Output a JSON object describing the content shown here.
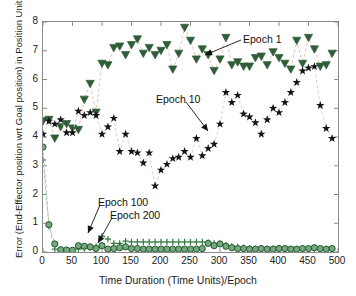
{
  "chart_data": {
    "type": "scatter",
    "title": "",
    "xlabel": "Time Duration (Time Units)/Epoch",
    "ylabel": "Error (End-Effector position wrt Goal position) in Position Units",
    "xlim": [
      0,
      500
    ],
    "ylim": [
      0,
      8
    ],
    "xticks": [
      0,
      50,
      100,
      150,
      200,
      250,
      300,
      350,
      400,
      450,
      500
    ],
    "yticks": [
      0,
      1,
      2,
      3,
      4,
      5,
      6,
      7,
      8
    ],
    "grid": false,
    "legend_position": "annotations-inline",
    "x": [
      0,
      10,
      20,
      30,
      40,
      50,
      60,
      70,
      80,
      90,
      100,
      110,
      120,
      130,
      140,
      150,
      160,
      170,
      180,
      190,
      200,
      210,
      220,
      230,
      240,
      250,
      260,
      270,
      280,
      290,
      300,
      310,
      320,
      330,
      340,
      350,
      360,
      370,
      380,
      390,
      400,
      410,
      420,
      430,
      440,
      450,
      460,
      470,
      480,
      490
    ],
    "series": [
      {
        "name": "Epoch 1",
        "marker": "triangle-down",
        "color": "#2f5d37",
        "line_color": "#e8b9a8",
        "values": [
          4.55,
          4.6,
          3.95,
          4.35,
          4.45,
          4.3,
          4.25,
          5.3,
          5.85,
          4.85,
          6.55,
          6.5,
          7.1,
          7.15,
          6.85,
          7.2,
          7.4,
          6.9,
          7.1,
          6.85,
          7.0,
          7.2,
          6.35,
          6.9,
          7.8,
          7.35,
          6.7,
          7.05,
          6.85,
          6.3,
          6.7,
          7.45,
          6.5,
          6.6,
          6.45,
          6.45,
          6.75,
          6.8,
          6.5,
          6.95,
          6.75,
          6.55,
          6.35,
          7.35,
          6.55,
          7.45,
          7.05,
          6.45,
          6.5,
          6.9
        ]
      },
      {
        "name": "Epoch 10",
        "marker": "star",
        "color": "#141414",
        "line_color": "#cccccc",
        "values": [
          4.1,
          4.55,
          4.45,
          4.6,
          4.15,
          4.15,
          4.9,
          4.75,
          4.85,
          4.75,
          4.1,
          4.35,
          4.65,
          3.5,
          4.1,
          3.5,
          3.45,
          3.1,
          3.45,
          2.3,
          2.85,
          3.05,
          3.25,
          3.3,
          3.5,
          3.3,
          3.95,
          3.35,
          3.6,
          3.75,
          4.45,
          5.55,
          5.2,
          5.45,
          4.8,
          4.7,
          4.5,
          4.1,
          4.6,
          5.0,
          4.85,
          5.2,
          5.55,
          5.9,
          6.3,
          6.4,
          6.45,
          5.1,
          4.3,
          3.95
        ]
      },
      {
        "name": "Epoch 100",
        "marker": "plus",
        "color": "#2f7a3f",
        "line_color": "#9dc7a4",
        "values": [
          3.2,
          0.9,
          0.1,
          0.05,
          0.05,
          0.05,
          0.1,
          0.12,
          0.15,
          0.2,
          0.55,
          0.45,
          0.3,
          0.3,
          0.38,
          0.35,
          0.35,
          0.35,
          0.35,
          0.35,
          0.35,
          0.35,
          0.35,
          0.35,
          0.35,
          0.35,
          0.35,
          0.35,
          0.33,
          0.3,
          0.28,
          0.25,
          0.2,
          0.18,
          0.15,
          0.13,
          0.12,
          0.12,
          0.12,
          0.12,
          0.12,
          0.12,
          0.1,
          0.1,
          0.1,
          0.1,
          0.1,
          0.1,
          0.1,
          0.1
        ]
      },
      {
        "name": "Epoch 200",
        "marker": "circle",
        "color": "#2f7a3f",
        "line_color": "#9dc7a4",
        "values": [
          3.65,
          0.95,
          0.28,
          0.08,
          0.07,
          0.06,
          0.22,
          0.2,
          0.18,
          0.12,
          0.22,
          0.1,
          0.12,
          0.15,
          0.18,
          0.12,
          0.12,
          0.1,
          0.1,
          0.1,
          0.1,
          0.1,
          0.1,
          0.1,
          0.1,
          0.1,
          0.1,
          0.12,
          0.3,
          0.22,
          0.28,
          0.2,
          0.15,
          0.12,
          0.12,
          0.1,
          0.1,
          0.12,
          0.1,
          0.1,
          0.12,
          0.12,
          0.1,
          0.1,
          0.12,
          0.12,
          0.15,
          0.12,
          0.1,
          0.12
        ]
      }
    ],
    "annotations": [
      {
        "text": "Epoch 1",
        "label_x": 243,
        "label_y": 33,
        "arrow_from_x": 241,
        "arrow_from_y": 40,
        "arrow_to_x": 205,
        "arrow_to_y": 55
      },
      {
        "text": "Epoch 10",
        "label_x": 156,
        "label_y": 93,
        "arrow_from_x": 186,
        "arrow_from_y": 102,
        "arrow_to_x": 208,
        "arrow_to_y": 131
      },
      {
        "text": "Epoch 100",
        "label_x": 98,
        "label_y": 196,
        "arrow_from_x": 100,
        "arrow_from_y": 205,
        "arrow_to_x": 88,
        "arrow_to_y": 233
      },
      {
        "text": "Epoch 200",
        "label_x": 110,
        "label_y": 209,
        "arrow_from_x": 112,
        "arrow_from_y": 218,
        "arrow_to_x": 98,
        "arrow_to_y": 243
      }
    ]
  },
  "axis": {
    "xtick_labels": [
      "0",
      "50",
      "100",
      "150",
      "200",
      "250",
      "300",
      "350",
      "400",
      "450",
      "500"
    ],
    "ytick_labels": [
      "0",
      "1",
      "2",
      "3",
      "4",
      "5",
      "6",
      "7",
      "8"
    ],
    "xlabel": "Time Duration (Time Units)/Epoch",
    "ylabel": "Error (End-Effector position wrt Goal position) in Position Units"
  }
}
